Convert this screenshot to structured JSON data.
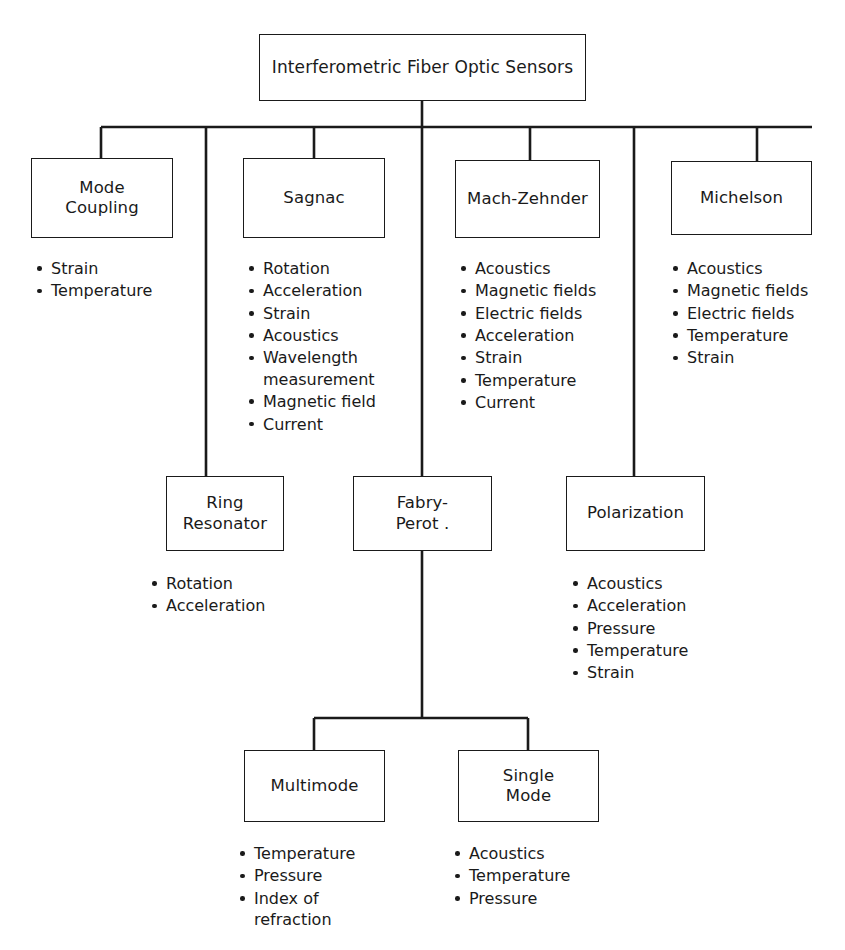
{
  "diagram": {
    "title": "Interferometric Fiber Optic Sensors",
    "line_color": "#1a1a1a",
    "background_color": "#ffffff",
    "bullet_char": "•",
    "nodes": {
      "root": "Interferometric Fiber Optic Sensors",
      "mode_coupling": "Mode\nCoupling",
      "sagnac": "Sagnac",
      "mach_zehnder": "Mach-Zehnder",
      "michelson": "Michelson",
      "ring_resonator": "Ring\nResonator",
      "fabry_perot": "Fabry-\nPerot .",
      "polarization": "Polarization",
      "multimode": "Multimode",
      "single_mode": "Single\nMode"
    },
    "lists": {
      "mode_coupling": [
        "Strain",
        "Temperature"
      ],
      "sagnac": [
        "Rotation",
        "Acceleration",
        "Strain",
        "Acoustics",
        "Wavelength\nmeasurement",
        "Magnetic field",
        "Current"
      ],
      "mach_zehnder": [
        "Acoustics",
        "Magnetic fields",
        "Electric fields",
        "Acceleration",
        "Strain",
        "Temperature",
        "Current"
      ],
      "michelson": [
        "Acoustics",
        "Magnetic fields",
        "Electric fields",
        "Temperature",
        "Strain"
      ],
      "ring_resonator": [
        "Rotation",
        "Acceleration"
      ],
      "polarization": [
        "Acoustics",
        "Acceleration",
        "Pressure",
        "Temperature",
        "Strain"
      ],
      "multimode": [
        "Temperature",
        "Pressure",
        "Index of\nrefraction"
      ],
      "single_mode": [
        "Acoustics",
        "Temperature",
        "Pressure"
      ]
    }
  }
}
